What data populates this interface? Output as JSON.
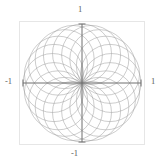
{
  "figure": {
    "name": "rosette-circle-plot",
    "background": "#ffffff",
    "width": 162,
    "height": 166
  },
  "frame": {
    "color": "#e3e3e3",
    "x": 19,
    "y": 21,
    "width": 126,
    "height": 124
  },
  "axes": {
    "color": "#6b6b6b",
    "x_axis_label_left": "-1",
    "x_axis_label_right": "1",
    "y_axis_label_top": "1",
    "y_axis_label_bottom": "-1",
    "origin_x": 82,
    "origin_y": 83
  },
  "chart_data": {
    "type": "line",
    "title": "",
    "subtitle": "",
    "xlabel": "",
    "ylabel": "",
    "xlim": [
      -1,
      1
    ],
    "ylim": [
      -1,
      1
    ],
    "xticks": [
      -1,
      1
    ],
    "yticks": [
      -1,
      1
    ],
    "xticklabels": [
      "-1",
      "1"
    ],
    "yticklabels": [
      "-1",
      "1"
    ],
    "grid": false,
    "legend": null,
    "legend_position": "none",
    "curve_color": "#9a9a9a",
    "curve_linewidth": 0.5,
    "series": [
      {
        "name": "circle-family",
        "count": 20,
        "circle_radius": 0.5,
        "center_locus_radius": 0.5,
        "angles_deg": [
          0,
          18,
          36,
          54,
          72,
          90,
          108,
          126,
          144,
          162,
          180,
          198,
          216,
          234,
          252,
          270,
          288,
          306,
          324,
          342
        ]
      }
    ]
  }
}
